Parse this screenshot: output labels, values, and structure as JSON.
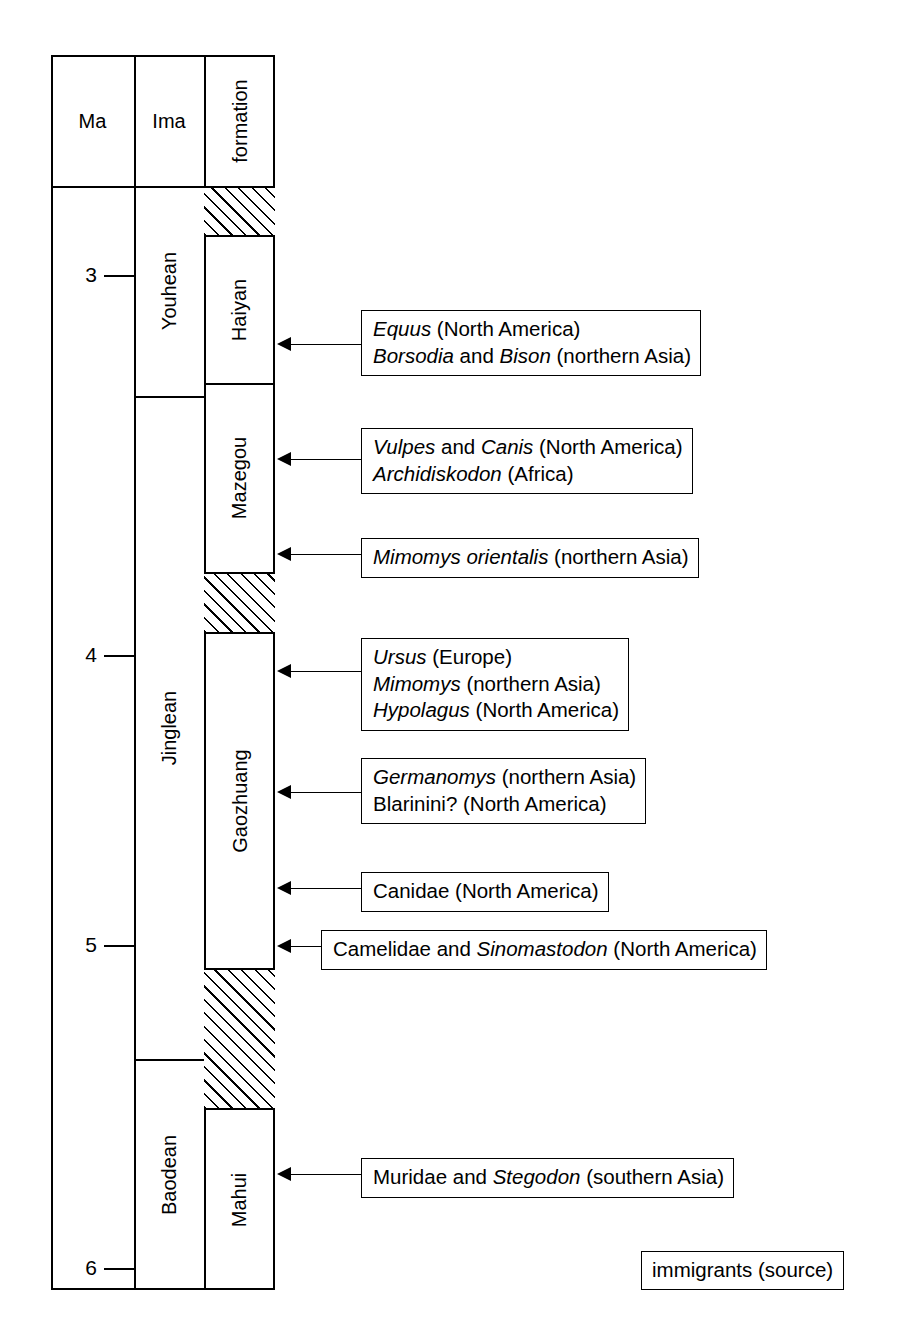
{
  "figure": {
    "type": "stratigraphic-column",
    "legend_label": "immigrants (source)"
  },
  "columns": {
    "headers": [
      {
        "key": "ma",
        "label": "Ma",
        "orientation": "horizontal"
      },
      {
        "key": "ima",
        "label": "Ima",
        "orientation": "horizontal"
      },
      {
        "key": "formation",
        "label": "formation",
        "orientation": "vertical"
      }
    ]
  },
  "axis": {
    "name": "Ma",
    "unit": "Ma",
    "direction": "increasing-downward",
    "ticks": [
      {
        "value": "3"
      },
      {
        "value": "4"
      },
      {
        "value": "5"
      },
      {
        "value": "6"
      }
    ]
  },
  "ima_units": [
    {
      "label": "Youhean"
    },
    {
      "label": "Jinglean"
    },
    {
      "label": "Baodean"
    }
  ],
  "formations": [
    {
      "label": "Haiyan"
    },
    {
      "label": "Mazegou"
    },
    {
      "label": "Gaozhuang"
    },
    {
      "label": "Mahui"
    }
  ],
  "hiatuses": [
    {
      "label": "hiatus-1"
    },
    {
      "label": "hiatus-2"
    },
    {
      "label": "hiatus-3"
    }
  ],
  "immigrant_events": [
    {
      "id": "event-equus",
      "lines": [
        [
          {
            "t": "Equus",
            "i": true
          },
          {
            "t": " (North America)",
            "i": false
          }
        ],
        [
          {
            "t": "Borsodia",
            "i": true
          },
          {
            "t": " and ",
            "i": false
          },
          {
            "t": "Bison",
            "i": true
          },
          {
            "t": " (northern Asia)",
            "i": false
          }
        ]
      ]
    },
    {
      "id": "event-vulpes",
      "lines": [
        [
          {
            "t": "Vulpes",
            "i": true
          },
          {
            "t": " and ",
            "i": false
          },
          {
            "t": "Canis",
            "i": true
          },
          {
            "t": " (North America)",
            "i": false
          }
        ],
        [
          {
            "t": "Archidiskodon",
            "i": true
          },
          {
            "t": " (Africa)",
            "i": false
          }
        ]
      ]
    },
    {
      "id": "event-mimomys-orientalis",
      "lines": [
        [
          {
            "t": "Mimomys orientalis",
            "i": true
          },
          {
            "t": " (northern Asia)",
            "i": false
          }
        ]
      ]
    },
    {
      "id": "event-ursus",
      "lines": [
        [
          {
            "t": "Ursus",
            "i": true
          },
          {
            "t": " (Europe)",
            "i": false
          }
        ],
        [
          {
            "t": "Mimomys",
            "i": true
          },
          {
            "t": " (northern Asia)",
            "i": false
          }
        ],
        [
          {
            "t": "Hypolagus",
            "i": true
          },
          {
            "t": " (North America)",
            "i": false
          }
        ]
      ]
    },
    {
      "id": "event-germanomys",
      "lines": [
        [
          {
            "t": "Germanomys",
            "i": true
          },
          {
            "t": " (northern Asia)",
            "i": false
          }
        ],
        [
          {
            "t": "Blarinini? (North America)",
            "i": false
          }
        ]
      ]
    },
    {
      "id": "event-canidae",
      "lines": [
        [
          {
            "t": "Canidae (North America)",
            "i": false
          }
        ]
      ]
    },
    {
      "id": "event-camelidae",
      "lines": [
        [
          {
            "t": "Camelidae and ",
            "i": false
          },
          {
            "t": "Sinomastodon",
            "i": true
          },
          {
            "t": " (North America)",
            "i": false
          }
        ]
      ]
    },
    {
      "id": "event-muridae",
      "lines": [
        [
          {
            "t": "Muridae and ",
            "i": false
          },
          {
            "t": "Stegodon",
            "i": true
          },
          {
            "t": " (southern Asia)",
            "i": false
          }
        ]
      ]
    }
  ],
  "chart_data": {
    "type": "table",
    "title": "",
    "xlabel": "",
    "ylabel": "Ma",
    "ylim": [
      2.55,
      6.15
    ],
    "grid": false,
    "legend_position": "bottom-right",
    "axis_ticks": [
      3,
      4,
      5,
      6
    ],
    "series": [
      {
        "name": "Ima",
        "values": [
          {
            "label": "Youhean",
            "top_ma": 2.72,
            "base_ma": 3.33
          },
          {
            "label": "Jinglean",
            "top_ma": 3.33,
            "base_ma": 5.27
          },
          {
            "label": "Baodean",
            "top_ma": 5.27,
            "base_ma": 6.15
          }
        ]
      },
      {
        "name": "formation",
        "values": [
          {
            "label": "hiatus",
            "top_ma": 2.72,
            "base_ma": 2.87,
            "hatched": true
          },
          {
            "label": "Haiyan",
            "top_ma": 2.87,
            "base_ma": 3.29,
            "hatched": false
          },
          {
            "label": "Mazegou",
            "top_ma": 3.29,
            "base_ma": 3.84,
            "hatched": false
          },
          {
            "label": "hiatus",
            "top_ma": 3.84,
            "base_ma": 4.02,
            "hatched": true
          },
          {
            "label": "Gaozhuang",
            "top_ma": 4.02,
            "base_ma": 5.32,
            "hatched": false
          },
          {
            "label": "hiatus",
            "top_ma": 5.32,
            "base_ma": 5.73,
            "hatched": true
          },
          {
            "label": "Mahui",
            "top_ma": 5.73,
            "base_ma": 6.15,
            "hatched": false
          }
        ]
      }
    ],
    "annotations": [
      {
        "ma": 3.06,
        "text": "Equus (North America) / Borsodia and Bison (northern Asia)"
      },
      {
        "ma": 3.46,
        "text": "Vulpes and Canis (North America) / Archidiskodon (Africa)"
      },
      {
        "ma": 3.82,
        "text": "Mimomys orientalis (northern Asia)"
      },
      {
        "ma": 4.08,
        "text": "Ursus (Europe) / Mimomys (northern Asia) / Hypolagus (North America)"
      },
      {
        "ma": 4.47,
        "text": "Germanomys (northern Asia) / Blarinini? (North America)"
      },
      {
        "ma": 4.83,
        "text": "Canidae (North America)"
      },
      {
        "ma": 5.08,
        "text": "Camelidae and Sinomastodon (North America)"
      },
      {
        "ma": 5.81,
        "text": "Muridae and Stegodon (southern Asia)"
      }
    ]
  }
}
